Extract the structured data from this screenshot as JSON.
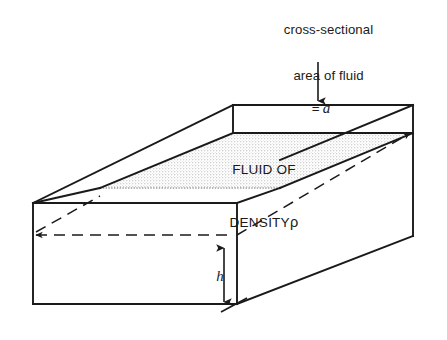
{
  "figure": {
    "background_color": "#ffffff",
    "line_color": "#1a1a1a",
    "fluid_fill_color": "#e8e8e8"
  },
  "callout": {
    "line1": "cross-sectional",
    "line2": "area of fluid",
    "equals": "=",
    "symbol": "a",
    "arrow": "down-arrow"
  },
  "fluid": {
    "line1": "FLUID OF",
    "line2_prefix": "DENSITY",
    "density_symbol": "ρ"
  },
  "height": {
    "symbol": "h",
    "arrow": "double-headed-vertical-arrow"
  },
  "geometry": {
    "type": "open-top-rectangular-tank",
    "visible_edge_style": "solid",
    "hidden_edge_style": "dashed",
    "fluid_surface_style": "stippled"
  }
}
